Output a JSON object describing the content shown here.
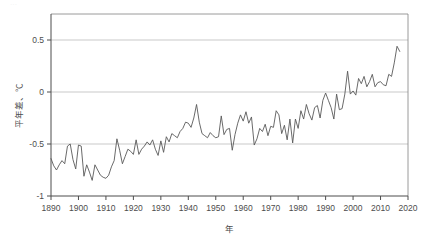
{
  "chart_data": {
    "type": "line",
    "title": "",
    "subtitle": "",
    "xlabel": "年",
    "ylabel": "平年差、℃",
    "xlim": [
      1890,
      2020
    ],
    "ylim": [
      -1,
      0.75
    ],
    "xticks": [
      1890,
      1900,
      1910,
      1920,
      1930,
      1940,
      1950,
      1960,
      1970,
      1980,
      1990,
      2000,
      2010,
      2020
    ],
    "yticks": [
      0.5,
      0,
      -0.5,
      -1
    ],
    "ytick_labels": [
      "0.5",
      "0",
      "-0.5",
      "-1"
    ],
    "grid": "horizontal",
    "legend": "none",
    "series": [
      {
        "name": "平年差",
        "color": "#595959",
        "x": [
          1890,
          1891,
          1892,
          1893,
          1894,
          1895,
          1896,
          1897,
          1898,
          1899,
          1900,
          1901,
          1902,
          1903,
          1904,
          1905,
          1906,
          1907,
          1908,
          1909,
          1910,
          1911,
          1912,
          1913,
          1914,
          1915,
          1916,
          1917,
          1918,
          1919,
          1920,
          1921,
          1922,
          1923,
          1924,
          1925,
          1926,
          1927,
          1928,
          1929,
          1930,
          1931,
          1932,
          1933,
          1934,
          1935,
          1936,
          1937,
          1938,
          1939,
          1940,
          1941,
          1942,
          1943,
          1944,
          1945,
          1946,
          1947,
          1948,
          1949,
          1950,
          1951,
          1952,
          1953,
          1954,
          1955,
          1956,
          1957,
          1958,
          1959,
          1960,
          1961,
          1962,
          1963,
          1964,
          1965,
          1966,
          1967,
          1968,
          1969,
          1970,
          1971,
          1972,
          1973,
          1974,
          1975,
          1976,
          1977,
          1978,
          1979,
          1980,
          1981,
          1982,
          1983,
          1984,
          1985,
          1986,
          1987,
          1988,
          1989,
          1990,
          1991,
          1992,
          1993,
          1994,
          1995,
          1996,
          1997,
          1998,
          1999,
          2000,
          2001,
          2002,
          2003,
          2004,
          2005,
          2006,
          2007,
          2008,
          2009,
          2010,
          2011,
          2012,
          2013,
          2014,
          2015,
          2016,
          2017
        ],
        "values": [
          -0.64,
          -0.71,
          -0.75,
          -0.7,
          -0.66,
          -0.69,
          -0.52,
          -0.5,
          -0.65,
          -0.74,
          -0.51,
          -0.52,
          -0.81,
          -0.7,
          -0.77,
          -0.85,
          -0.7,
          -0.75,
          -0.8,
          -0.82,
          -0.83,
          -0.8,
          -0.72,
          -0.66,
          -0.45,
          -0.56,
          -0.69,
          -0.62,
          -0.55,
          -0.57,
          -0.6,
          -0.46,
          -0.6,
          -0.55,
          -0.52,
          -0.48,
          -0.51,
          -0.46,
          -0.55,
          -0.61,
          -0.47,
          -0.58,
          -0.43,
          -0.48,
          -0.4,
          -0.42,
          -0.44,
          -0.38,
          -0.35,
          -0.29,
          -0.3,
          -0.34,
          -0.25,
          -0.12,
          -0.29,
          -0.4,
          -0.42,
          -0.44,
          -0.39,
          -0.42,
          -0.44,
          -0.43,
          -0.23,
          -0.41,
          -0.36,
          -0.35,
          -0.56,
          -0.41,
          -0.3,
          -0.22,
          -0.28,
          -0.19,
          -0.3,
          -0.24,
          -0.51,
          -0.45,
          -0.35,
          -0.38,
          -0.31,
          -0.42,
          -0.33,
          -0.34,
          -0.18,
          -0.22,
          -0.4,
          -0.32,
          -0.46,
          -0.26,
          -0.49,
          -0.26,
          -0.35,
          -0.18,
          -0.26,
          -0.12,
          -0.21,
          -0.27,
          -0.15,
          -0.13,
          -0.25,
          -0.08,
          -0.01,
          -0.08,
          -0.15,
          -0.26,
          -0.02,
          -0.17,
          -0.16,
          -0.02,
          0.2,
          -0.02,
          0.01,
          -0.03,
          0.13,
          0.08,
          0.15,
          0.05,
          0.1,
          0.17,
          0.05,
          0.09,
          0.1,
          0.07,
          0.06,
          0.17,
          0.15,
          0.28,
          0.44,
          0.39
        ]
      }
    ]
  },
  "axis": {
    "y_tick_labels": [
      "0.5",
      "0",
      "-0.5",
      "-1"
    ],
    "x_tick_labels": [
      "1890",
      "1900",
      "1910",
      "1920",
      "1930",
      "1940",
      "1950",
      "1960",
      "1970",
      "1980",
      "1990",
      "2000",
      "2010",
      "2020"
    ],
    "y_axis_title": "平年差、℃",
    "x_axis_title": "年"
  },
  "colors": {
    "line": "#595959",
    "grid": "#b3b3b3",
    "axis": "#4d4d4d",
    "background": "#ffffff",
    "text": "#4d4d4d"
  }
}
